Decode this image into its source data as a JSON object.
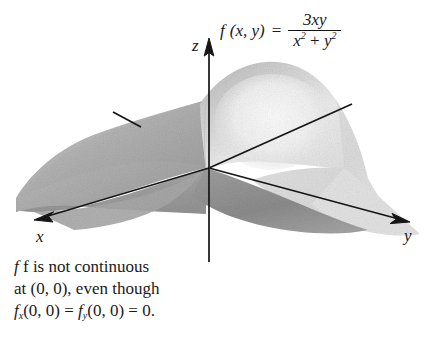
{
  "figure": {
    "kind": "3d-surface-plot",
    "background_color": "#ffffff",
    "ink_color": "#1a1a1a"
  },
  "formula": {
    "function_name": "f",
    "arguments": "(x, y)",
    "equals": "=",
    "numerator": "3xy",
    "denominator_first": "x",
    "denominator_first_exp": "2",
    "denominator_plus": "+",
    "denominator_second": "y",
    "denominator_second_exp": "2",
    "plain_text": "f(x, y) = 3xy / (x^2 + y^2)"
  },
  "axes": {
    "z_label": "z",
    "x_label": "x",
    "y_label": "y",
    "origin": {
      "x": 209,
      "y": 168
    }
  },
  "caption": {
    "line1": "f is not continuous",
    "line2": "at (0, 0), even though",
    "line3_fx": "f",
    "line3_fx_sub": "x",
    "line3_mid": "(0, 0) =",
    "line3_fy": "f",
    "line3_fy_sub": "y",
    "line3_end": "(0, 0) = 0.",
    "plain_text": "f is not continuous at (0, 0), even though f_x(0, 0) = f_y(0, 0) = 0."
  },
  "surface": {
    "description": "Saddle surface z = 3xy/(x^2+y^2) rendered in greyscale with a raised ridge toward the back-right and folded sheets dropping toward the front",
    "tone_light": "#ebebeb",
    "tone_mid_light": "#d2d2d2",
    "tone_mid": "#b4b4b4",
    "tone_mid_dark": "#a0a0a0",
    "tone_dark": "#8d8d8d",
    "tone_darkest": "#7e7e7e"
  }
}
